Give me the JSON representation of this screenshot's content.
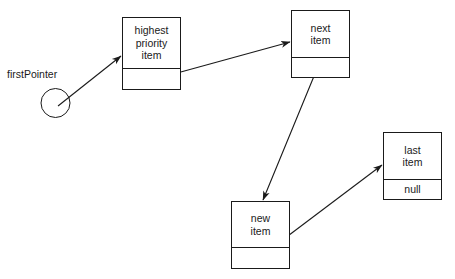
{
  "diagram": {
    "background_color": "#ffffff",
    "stroke_color": "#1a1a1a",
    "pointer": {
      "label": "firstPointer",
      "shape": "circle",
      "center_x": 55.5,
      "center_y": 103,
      "radius": 14.5,
      "label_x": 7,
      "label_y": 68
    },
    "nodes": [
      {
        "id": "highest-priority-item",
        "data_lines": [
          "highest",
          "priority",
          "item"
        ],
        "link_text": "",
        "x": 122,
        "y": 17,
        "width": 59,
        "height": 73,
        "divider_offset": 51
      },
      {
        "id": "next-item",
        "data_lines": [
          "next",
          "item"
        ],
        "link_text": "",
        "x": 291,
        "y": 10,
        "width": 59,
        "height": 68,
        "divider_offset": 47
      },
      {
        "id": "new-item",
        "data_lines": [
          "new",
          "item"
        ],
        "link_text": "",
        "x": 231,
        "y": 201,
        "width": 59,
        "height": 68,
        "divider_offset": 46
      },
      {
        "id": "last-item",
        "data_lines": [
          "last",
          "item"
        ],
        "link_text": "null",
        "x": 383,
        "y": 132,
        "width": 59,
        "height": 68,
        "divider_offset": 47
      }
    ],
    "arrows": [
      {
        "id": "firstpointer-to-highest",
        "from": "firstPointer",
        "to": "highest priority item",
        "x1": 58,
        "y1": 106,
        "x2": 121,
        "y2": 56
      },
      {
        "id": "highest-to-next",
        "from": "highest priority item",
        "to": "next item",
        "x1": 148,
        "y1": 81,
        "x2": 290,
        "y2": 42
      },
      {
        "id": "next-to-new",
        "from": "next item",
        "to": "new item",
        "x1": 319,
        "y1": 64,
        "x2": 263,
        "y2": 200
      },
      {
        "id": "new-to-last",
        "from": "new item",
        "to": "last item",
        "x1": 256,
        "y1": 260,
        "x2": 382,
        "y2": 165
      }
    ]
  }
}
